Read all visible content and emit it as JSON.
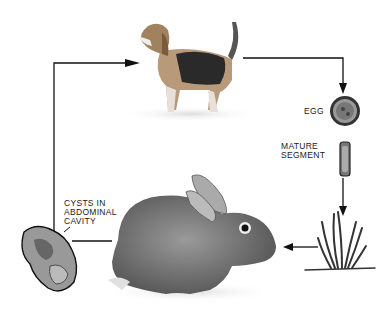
{
  "diagram": {
    "type": "life-cycle",
    "stages": [
      {
        "name": "dog",
        "label": ""
      },
      {
        "name": "egg",
        "label": "EGG"
      },
      {
        "name": "mature-segment",
        "label": "MATURE SEGMENT"
      },
      {
        "name": "grass",
        "label": ""
      },
      {
        "name": "rabbit",
        "label": ""
      },
      {
        "name": "cysts",
        "label": "CYSTS IN ABDOMINAL CAVITY"
      }
    ],
    "labels": {
      "egg": "EGG",
      "segment_line1": "MATURE",
      "segment_line2": "SEGMENT",
      "cysts_line1": "CYSTS IN",
      "cysts_line2": "ABDOMINAL",
      "cysts_line3": "CAVITY"
    },
    "colors": {
      "line": "#111111",
      "background": "#ffffff"
    }
  }
}
